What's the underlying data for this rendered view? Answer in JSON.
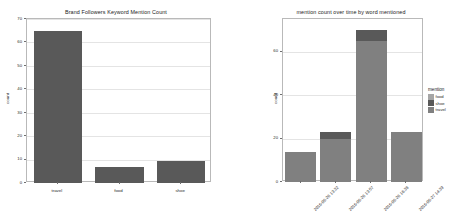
{
  "page": {
    "background": "#ffffff",
    "width": 464,
    "height": 224
  },
  "palette": {
    "bar_dark": "#595959",
    "bar_mid": "#808080",
    "bar_light": "#a6a6a6",
    "grid": "#e4e4e4",
    "axis": "#b9b9b9",
    "text": "#2b2b2b"
  },
  "charts": [
    {
      "id": "brand-followers-keyword-mention-count",
      "type": "bar",
      "title": "Brand Followers Keyword Mention Count",
      "xlabel": "",
      "ylabel": "count",
      "categories": [
        "travel",
        "food",
        "shoe"
      ],
      "values": [
        65,
        7,
        9.5
      ],
      "ylim": [
        0,
        70
      ],
      "yticks": [
        0,
        10,
        20,
        30,
        40,
        50,
        60,
        70
      ],
      "ytick_labels": [
        "0",
        "10",
        "20",
        "30",
        "40",
        "50",
        "60",
        "70"
      ],
      "grid": true,
      "legend": false,
      "bar_color": "#595959"
    },
    {
      "id": "mention-count-over-time-by-word-mentioned",
      "type": "bar",
      "stacked": true,
      "title": "mention count over time by word mentioned",
      "xlabel": "",
      "ylabel": "count",
      "categories": [
        "2016-06-26 13:32",
        "2016-06-26 13:57",
        "2016-06-26 16:38",
        "2016-06-27 14:39"
      ],
      "series": [
        {
          "name": "travel",
          "values": [
            14,
            20,
            65,
            23
          ],
          "color": "#808080"
        },
        {
          "name": "shoe",
          "values": [
            0,
            3,
            5,
            0
          ],
          "color": "#595959"
        },
        {
          "name": "food",
          "values": [
            0,
            0,
            0,
            0
          ],
          "color": "#a6a6a6"
        }
      ],
      "totals": [
        14,
        23,
        70,
        23
      ],
      "ylim": [
        0,
        75
      ],
      "yticks": [
        0,
        20,
        40,
        60
      ],
      "ytick_labels": [
        "0",
        "20",
        "40",
        "60"
      ],
      "grid": true,
      "legend": {
        "title": "mention",
        "position": "right",
        "entries": [
          {
            "label": "food",
            "color": "#a6a6a6"
          },
          {
            "label": "shoe",
            "color": "#595959"
          },
          {
            "label": "travel",
            "color": "#808080"
          }
        ]
      }
    }
  ]
}
